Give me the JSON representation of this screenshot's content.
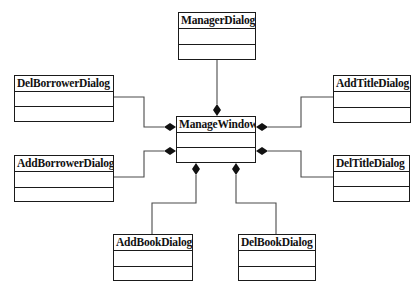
{
  "diagram": {
    "type": "UML class diagram",
    "relationship": "composition",
    "center": "ManageWindow",
    "classes": [
      {
        "id": "managerDialog",
        "name": "ManagerDialog",
        "x": 178,
        "y": 12,
        "w": 78,
        "h": 48,
        "attrs_h": 16
      },
      {
        "id": "manageWindow",
        "name": "ManageWindow",
        "x": 176,
        "y": 116,
        "w": 80,
        "h": 47,
        "attrs_h": 15
      },
      {
        "id": "delBorrowerDialog",
        "name": "DelBorrowerDialog",
        "x": 14,
        "y": 75,
        "w": 100,
        "h": 47,
        "attrs_h": 15
      },
      {
        "id": "addBorrowerDialog",
        "name": "AddBorrowerDialog",
        "x": 14,
        "y": 155,
        "w": 100,
        "h": 47,
        "attrs_h": 16
      },
      {
        "id": "addTitleDialog",
        "name": "AddTitleDialog",
        "x": 333,
        "y": 75,
        "w": 78,
        "h": 48,
        "attrs_h": 16
      },
      {
        "id": "delTitleDialog",
        "name": "DelTitleDialog",
        "x": 333,
        "y": 155,
        "w": 77,
        "h": 47,
        "attrs_h": 15
      },
      {
        "id": "addBookDialog",
        "name": "AddBookDialog",
        "x": 113,
        "y": 234,
        "w": 80,
        "h": 47,
        "attrs_h": 16
      },
      {
        "id": "delBookDialog",
        "name": "DelBookDialog",
        "x": 238,
        "y": 234,
        "w": 78,
        "h": 47,
        "attrs_h": 16
      }
    ],
    "associations": [
      {
        "from": "ManagerDialog",
        "to": "ManageWindow",
        "points": "217,60 217,104",
        "diamond": {
          "x": 217,
          "y": 110,
          "dir": "v"
        }
      },
      {
        "from": "DelBorrowerDialog",
        "to": "ManageWindow",
        "points": "114,97 144,97 144,127 164,127",
        "diamond": {
          "x": 170,
          "y": 127,
          "dir": "h"
        }
      },
      {
        "from": "AddBorrowerDialog",
        "to": "ManageWindow",
        "points": "114,177 144,177 144,151 164,151",
        "diamond": {
          "x": 170,
          "y": 151,
          "dir": "h"
        }
      },
      {
        "from": "AddTitleDialog",
        "to": "ManageWindow",
        "points": "333,97 301,97 301,127 268,127",
        "diamond": {
          "x": 262,
          "y": 127,
          "dir": "h"
        }
      },
      {
        "from": "DelTitleDialog",
        "to": "ManageWindow",
        "points": "333,177 301,177 301,151 268,151",
        "diamond": {
          "x": 262,
          "y": 151,
          "dir": "h"
        }
      },
      {
        "from": "AddBookDialog",
        "to": "ManageWindow",
        "points": "152,234 152,203 196,203 196,175",
        "diamond": {
          "x": 196,
          "y": 169,
          "dir": "v"
        }
      },
      {
        "from": "DelBookDialog",
        "to": "ManageWindow",
        "points": "276,234 276,203 236,203 236,175",
        "diamond": {
          "x": 236,
          "y": 169,
          "dir": "v"
        }
      }
    ],
    "colors": {
      "line": "#4a4a4a",
      "border": "#1a1a1a",
      "diamond": "#111111",
      "background": "#ffffff"
    }
  }
}
